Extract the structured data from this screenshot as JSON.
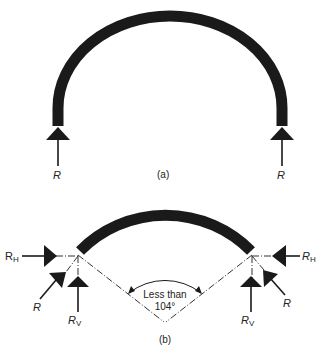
{
  "figure_a": {
    "caption": "(a)",
    "left_reaction_label": "R",
    "right_reaction_label": "R"
  },
  "figure_b": {
    "caption": "(b)",
    "left": {
      "horizontal_label_main": "R",
      "horizontal_label_sub": "H",
      "resultant_label": "R",
      "vertical_label_main": "R",
      "vertical_label_sub": "V"
    },
    "right": {
      "horizontal_label_main": "R",
      "horizontal_label_sub": "H",
      "resultant_label": "R",
      "vertical_label_main": "R",
      "vertical_label_sub": "V"
    },
    "angle_label_line1": "Less than",
    "angle_label_line2": "104°"
  },
  "colors": {
    "ink": "#1a1a1a",
    "background": "#ffffff"
  }
}
